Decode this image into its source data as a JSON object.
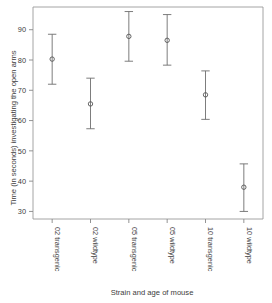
{
  "chart_data": {
    "type": "scatter",
    "title": "",
    "xlabel": "Strain and age of mouse",
    "ylabel": "Time (in seconds) investigating the open arms",
    "categories": [
      "02 transgenic",
      "02 wildtype",
      "05 transgenic",
      "05 wildtype",
      "10 transgenic",
      "10 wildtype"
    ],
    "values": [
      80.3,
      65.5,
      87.8,
      86.5,
      68.5,
      38.0
    ],
    "error_lower": [
      72.0,
      57.3,
      79.6,
      78.3,
      60.4,
      30.0
    ],
    "error_upper": [
      88.5,
      74.0,
      96.0,
      95.0,
      76.4,
      45.7
    ],
    "ylim": [
      27.5,
      97.5
    ],
    "yticks": [
      30,
      40,
      50,
      60,
      70,
      80,
      90
    ],
    "ytick_labels": [
      "30",
      "40",
      "50",
      "60",
      "70",
      "80",
      "90"
    ],
    "grid": false,
    "legend": "none",
    "marker": "open-circle",
    "series": [
      {
        "name": "mean with error bars",
        "points": [
          {
            "category": "02 transgenic",
            "mean": 80.3,
            "lower": 72.0,
            "upper": 88.5
          },
          {
            "category": "02 wildtype",
            "mean": 65.5,
            "lower": 57.3,
            "upper": 74.0
          },
          {
            "category": "05 transgenic",
            "mean": 87.8,
            "lower": 79.6,
            "upper": 96.0
          },
          {
            "category": "05 wildtype",
            "mean": 86.5,
            "lower": 78.3,
            "upper": 95.0
          },
          {
            "category": "10 transgenic",
            "mean": 68.5,
            "lower": 60.4,
            "upper": 76.4
          },
          {
            "category": "10 wildtype",
            "mean": 38.0,
            "lower": 30.0,
            "upper": 45.7
          }
        ]
      }
    ],
    "colors": {
      "marker": "#555555",
      "errorbar": "#6e6e6e",
      "axis": "#888888",
      "text": "#3d3d3d",
      "background": "#ffffff"
    }
  }
}
